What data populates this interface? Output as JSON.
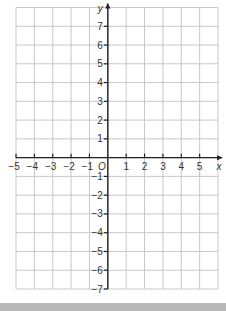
{
  "diagram": {
    "type": "coordinate-grid",
    "x_axis": {
      "label": "x",
      "min": -5,
      "max": 5,
      "tick_labels": [
        "-5",
        "-4",
        "-3",
        "-2",
        "-1",
        "1",
        "2",
        "3",
        "4",
        "5"
      ]
    },
    "y_axis": {
      "label": "y",
      "min": -7,
      "max": 7,
      "tick_labels": [
        "7",
        "6",
        "5",
        "4",
        "3",
        "2",
        "1",
        "-1",
        "-2",
        "-3",
        "-4",
        "-5",
        "-6",
        "-7"
      ]
    },
    "origin_label": "O",
    "grid": {
      "columns": 11,
      "rows": 15,
      "x_range_cells": [
        -5,
        6
      ],
      "y_range_cells": [
        -7,
        8
      ]
    },
    "colors": {
      "grid_line": "#c8c8c8",
      "axis": "#222222",
      "label": "#333333",
      "bottom_bar": "#b9b9b9"
    }
  }
}
